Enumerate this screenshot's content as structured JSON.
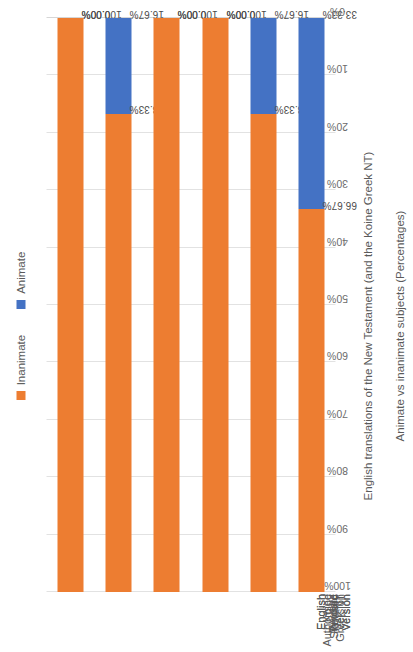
{
  "chart_data": {
    "type": "bar",
    "orientation": "horizontal-stacked-100",
    "title": "",
    "xlabel": "English translations of the New Testament (and the Koine Greek NT)",
    "ylabel": "Animate vs inanimate subjects (Percentages)",
    "categories": [
      "Wycliffe",
      "Tyndale",
      "Authorised Version",
      "English Revised Version",
      "English Standard Version",
      "Koine Greek NT"
    ],
    "series": [
      {
        "name": "Inanimate",
        "color": "#ED7D31",
        "values": [
          100.0,
          83.33,
          100.0,
          100.0,
          83.33,
          66.67
        ],
        "labels": [
          "100.00%",
          "83.33%",
          "100.00%",
          "100.00%",
          "83.33%",
          "66.67%"
        ]
      },
      {
        "name": "Animate",
        "color": "#4472C4",
        "values": [
          0.0,
          16.67,
          0.0,
          0.0,
          16.67,
          33.33
        ],
        "labels": [
          "0.00%",
          "16.67%",
          "0.00%",
          "0.00%",
          "16.67%",
          "33.33%"
        ]
      }
    ],
    "ylim": [
      0,
      100
    ],
    "y_ticks": [
      "100%",
      "90%",
      "80%",
      "70%",
      "60%",
      "50%",
      "40%",
      "30%",
      "20%",
      "10%",
      "0%"
    ],
    "grid": true,
    "legend_position": "top"
  },
  "legend": {
    "entries": [
      {
        "label": "Inanimate",
        "color": "#ED7D31"
      },
      {
        "label": "Animate",
        "color": "#4472C4"
      }
    ]
  }
}
